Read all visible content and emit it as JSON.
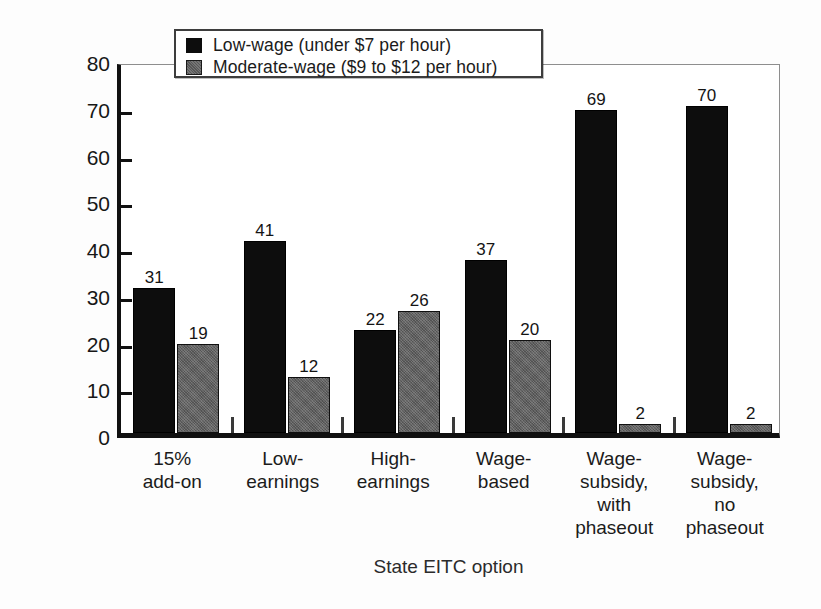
{
  "chart_data": {
    "type": "bar",
    "title": "",
    "xlabel": "State EITC option",
    "ylabel": "Percentage",
    "ylim": [
      0,
      80
    ],
    "yticks": [
      0,
      10,
      20,
      30,
      40,
      50,
      60,
      70,
      80
    ],
    "grid": false,
    "legend_position": "top-left-inset",
    "categories": [
      "15%\nadd-on",
      "Low-\nearnings",
      "High-\nearnings",
      "Wage-\nbased",
      "Wage-\nsubsidy,\nwith\nphaseout",
      "Wage-\nsubsidy,\nno\nphaseout"
    ],
    "series": [
      {
        "name": "Low-wage (under $7 per hour)",
        "color": "#0d0d0d",
        "values": [
          31,
          41,
          22,
          37,
          69,
          70
        ]
      },
      {
        "name": "Moderate-wage ($9 to $12 per hour)",
        "color": "#636363",
        "values": [
          19,
          12,
          26,
          20,
          2,
          2
        ]
      }
    ]
  },
  "legend": {
    "items": [
      {
        "label": "Low-wage (under $7 per hour)",
        "swatch": "low"
      },
      {
        "label": "Moderate-wage ($9 to $12 per hour)",
        "swatch": "mod"
      }
    ]
  },
  "axes": {
    "y_title": "Percentage",
    "x_title": "State EITC option",
    "y_tick_labels": [
      "80",
      "70",
      "60",
      "50",
      "40",
      "30",
      "20",
      "10",
      "0"
    ]
  }
}
